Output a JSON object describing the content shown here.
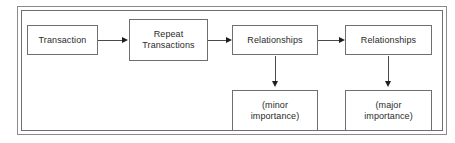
{
  "diagram": {
    "frame": {
      "style": "double-line-rectangle",
      "border_color": "#8a8a8a"
    },
    "nodes": [
      {
        "id": "transaction",
        "label": "Transaction"
      },
      {
        "id": "repeat-transactions",
        "label": "Repeat\nTransactions"
      },
      {
        "id": "relationships-minor",
        "label": "Relationships"
      },
      {
        "id": "relationships-major",
        "label": "Relationships"
      },
      {
        "id": "minor-importance",
        "label": "(minor\nimportance)"
      },
      {
        "id": "major-importance",
        "label": "(major\nimportance)"
      }
    ],
    "edges": [
      {
        "from": "transaction",
        "to": "repeat-transactions",
        "direction": "right"
      },
      {
        "from": "repeat-transactions",
        "to": "relationships-minor",
        "direction": "right"
      },
      {
        "from": "relationships-minor",
        "to": "relationships-major",
        "direction": "right"
      },
      {
        "from": "relationships-minor",
        "to": "minor-importance",
        "direction": "down"
      },
      {
        "from": "relationships-major",
        "to": "major-importance",
        "direction": "down"
      }
    ],
    "colors": {
      "background": "#ffffff",
      "node_border": "#6f6f6f",
      "connector": "#4a4a4a",
      "arrowhead": "#1f1f1f",
      "text": "#2b2b2b"
    }
  }
}
